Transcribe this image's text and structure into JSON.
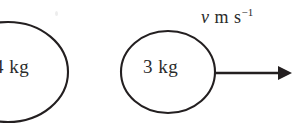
{
  "figure": {
    "background_color": "#ffffff",
    "stroke_color": "#231f20",
    "text_color": "#2b2b2b",
    "width": 301,
    "height": 124
  },
  "masses": [
    {
      "id": "left-mass",
      "label": "4 kg",
      "shape": "circle",
      "clipped": "left-and-bottom",
      "center_x": 8,
      "center_y": 72,
      "radius_x": 60,
      "radius_y": 50
    },
    {
      "id": "right-mass",
      "label": "3 kg",
      "shape": "circle",
      "clipped": "bottom",
      "center_x": 168,
      "center_y": 72,
      "radius_x": 47,
      "radius_y": 41
    }
  ],
  "velocity_arrow": {
    "label_symbol": "v",
    "label_unit": "m s",
    "label_exponent": "−1",
    "label_full": "v m s−1",
    "direction": "right",
    "start_x": 215,
    "end_x": 291,
    "y": 73
  }
}
